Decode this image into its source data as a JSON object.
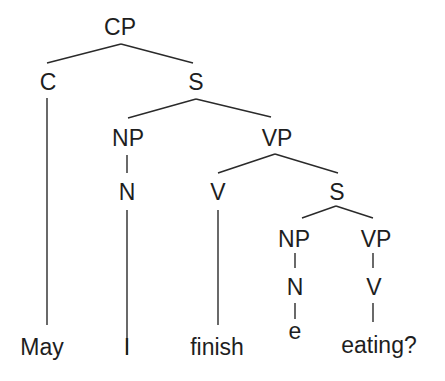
{
  "diagram": {
    "type": "syntax-tree",
    "root": {
      "label": "CP",
      "children": [
        {
          "label": "C",
          "children": [
            {
              "label": "May",
              "leaf": true
            }
          ]
        },
        {
          "label": "S",
          "children": [
            {
              "label": "NP",
              "children": [
                {
                  "label": "N",
                  "children": [
                    {
                      "label": "I",
                      "leaf": true
                    }
                  ]
                }
              ]
            },
            {
              "label": "VP",
              "children": [
                {
                  "label": "V",
                  "children": [
                    {
                      "label": "finish",
                      "leaf": true
                    }
                  ]
                },
                {
                  "label": "S",
                  "children": [
                    {
                      "label": "NP",
                      "children": [
                        {
                          "label": "N",
                          "children": [
                            {
                              "label": "e",
                              "leaf": true
                            }
                          ]
                        }
                      ]
                    },
                    {
                      "label": "VP",
                      "children": [
                        {
                          "label": "V",
                          "children": [
                            {
                              "label": "eating?",
                              "leaf": true
                            }
                          ]
                        }
                      ]
                    }
                  ]
                }
              ]
            }
          ]
        }
      ]
    },
    "nodes": {
      "cp": "CP",
      "c": "C",
      "s_main": "S",
      "np_main": "NP",
      "vp_main": "VP",
      "n_main": "N",
      "v_main": "V",
      "s_embedded": "S",
      "np_embedded": "NP",
      "vp_embedded": "VP",
      "n_embedded": "N",
      "v_embedded": "V",
      "empty_subject": "e"
    },
    "leaves": [
      "May",
      "I",
      "finish",
      "e",
      "eating?"
    ],
    "leaf_words": {
      "may": "May",
      "i": "I",
      "finish": "finish",
      "eating": "eating?"
    }
  }
}
